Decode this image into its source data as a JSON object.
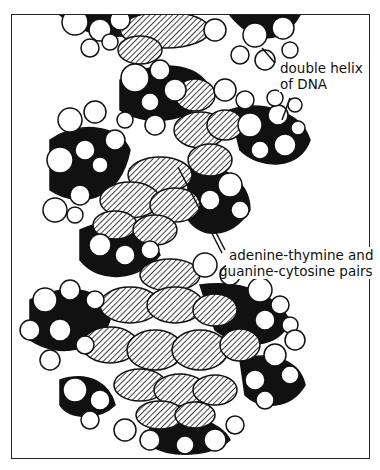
{
  "figure": {
    "labels": {
      "helix_line1": "double helix",
      "helix_line2": "of DNA",
      "pairs_line1": "adenine-thymine and",
      "pairs_line2": "guanine-cytosine pairs"
    },
    "colors": {
      "ink": "#111111",
      "paper": "#ffffff",
      "frame": "#222222"
    }
  }
}
